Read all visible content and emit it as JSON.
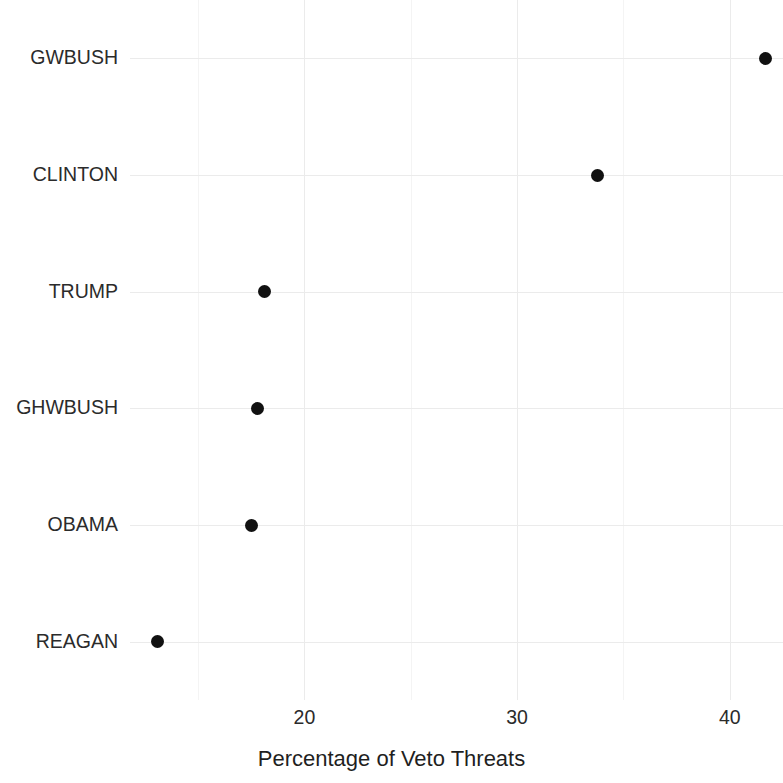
{
  "chart_data": {
    "type": "scatter",
    "title": "",
    "subtitle": "",
    "xlabel": "Percentage of Veto Threats",
    "ylabel": "",
    "categories": [
      "GWBUSH",
      "CLINTON",
      "TRUMP",
      "GHWBUSH",
      "OBAMA",
      "REAGAN"
    ],
    "values": [
      41.7,
      33.8,
      18.1,
      17.8,
      17.5,
      13.1
    ],
    "points": [
      {
        "category": "GWBUSH",
        "value": 41.7
      },
      {
        "category": "CLINTON",
        "value": 33.8
      },
      {
        "category": "TRUMP",
        "value": 18.1
      },
      {
        "category": "GHWBUSH",
        "value": 17.8
      },
      {
        "category": "OBAMA",
        "value": 17.5
      },
      {
        "category": "REAGAN",
        "value": 13.1
      }
    ],
    "x_ticks": [
      20,
      30,
      40
    ],
    "x_tick_labels": [
      "20",
      "30",
      "40"
    ],
    "x_minor_ticks": [
      15,
      25,
      35
    ],
    "xlim": [
      11.8,
      42.5
    ],
    "grid": true,
    "legend": null,
    "point_color": "#111111",
    "grid_color": "#ebebeb",
    "background_color": "#ffffff",
    "text_color": "#2b2b2b"
  },
  "axis": {
    "x_title": "Percentage of Veto Threats"
  }
}
